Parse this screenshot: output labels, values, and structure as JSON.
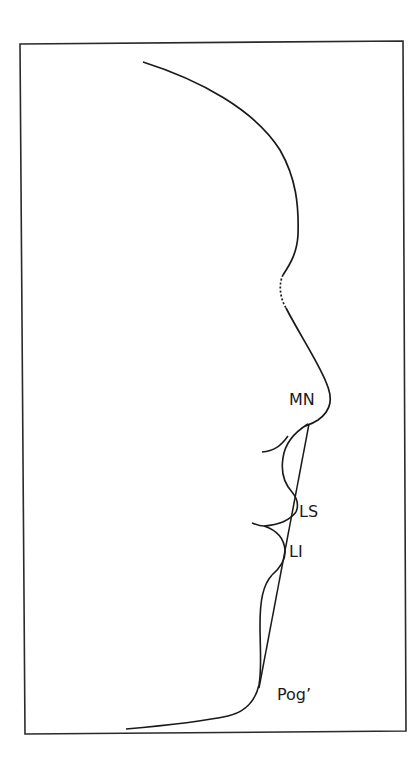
{
  "figure": {
    "type": "soft-tissue profile tracing",
    "frame_color": "#2a2a2a",
    "line_color": "#1a1a1a"
  },
  "labels": {
    "mn": "MN",
    "ls": "LS",
    "li": "LI",
    "pog": "Pog’"
  },
  "lines": {
    "profile": "facial soft-tissue profile",
    "e_line": "esthetic reference line from nose tip to soft-tissue pogonion",
    "dotted_segment": "dotted segment at nasion region"
  }
}
